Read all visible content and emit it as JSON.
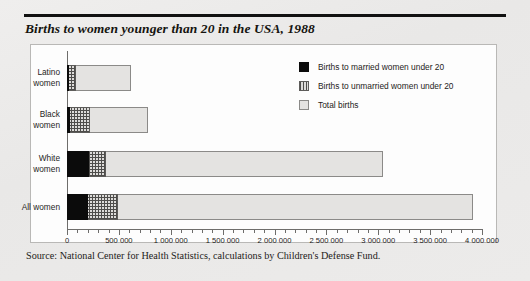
{
  "title": "Births to women younger than 20 in the USA, 1988",
  "source": "Source: National Center for Health Statistics, calculations by Children's Defense Fund.",
  "legend": {
    "items": [
      {
        "label": "Births to married women under 20",
        "key": "married",
        "color": "#0b0b0b"
      },
      {
        "label": "Births to unmarried women under 20",
        "key": "unmarried",
        "color": "#5d5c5a"
      },
      {
        "label": "Total births",
        "key": "total",
        "color": "#e4e3e1"
      }
    ]
  },
  "axis": {
    "ticklabels": [
      "0",
      "500 000",
      "1 000 000",
      "1 500 000",
      "2 000 000",
      "2 500 000",
      "3 000 000",
      "3 500 000",
      "4 000 000"
    ]
  },
  "categories": [
    {
      "line1": "Latino",
      "line2": "women"
    },
    {
      "line1": "Black",
      "line2": "women"
    },
    {
      "line1": "White",
      "line2": "women"
    },
    {
      "line1": "All women",
      "line2": ""
    }
  ],
  "chart_data": {
    "type": "bar",
    "orientation": "horizontal",
    "title": "Births to women younger than 20 in the USA, 1988",
    "xlabel": "",
    "ylabel": "",
    "xlim": [
      0,
      4000000
    ],
    "xticks": [
      0,
      500000,
      1000000,
      1500000,
      2000000,
      2500000,
      3000000,
      3500000,
      4000000
    ],
    "grid": false,
    "legend_position": "upper right",
    "categories": [
      "Latino women",
      "Black women",
      "White women",
      "All women"
    ],
    "series": [
      {
        "name": "Births to married women under 20",
        "values": [
          15000,
          25000,
          210000,
          200000
        ]
      },
      {
        "name": "Births to unmarried women under 20",
        "values": [
          90000,
          225000,
          375000,
          490000
        ]
      },
      {
        "name": "Total births",
        "values": [
          620000,
          785000,
          3050000,
          3910000
        ]
      }
    ],
    "note": "Segments are overlaid left-aligned: total births spans the full bar; unmarried and married are nested sub-segments measured from zero.",
    "source": "Source: National Center for Health Statistics, calculations by Children's Defense Fund."
  }
}
